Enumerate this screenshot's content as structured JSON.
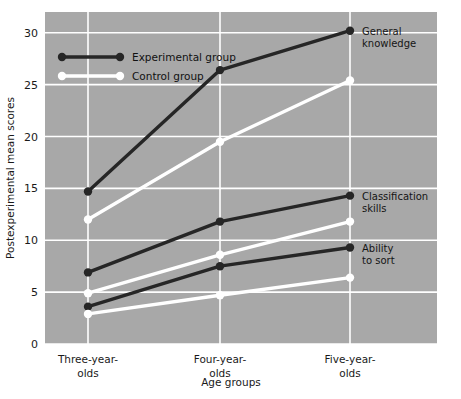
{
  "chart_data": {
    "type": "line",
    "title": "",
    "xlabel": "Age groups",
    "ylabel": "Postexperimental mean scores",
    "categories": [
      "Three-year-\nolds",
      "Four-year-\nolds",
      "Five-year-\nolds"
    ],
    "category_lines": [
      [
        "Three-year-",
        "olds"
      ],
      [
        "Four-year-",
        "olds"
      ],
      [
        "Five-year-",
        "olds"
      ]
    ],
    "x": [
      0,
      1,
      2
    ],
    "ylim": [
      0,
      32
    ],
    "yticks": [
      0,
      5,
      10,
      15,
      20,
      25,
      30
    ],
    "ytick_labels": [
      "0",
      "5",
      "10",
      "15",
      "20",
      "25",
      "30"
    ],
    "grid": true,
    "grid_color": "#ffffff",
    "plot_background": "#a8a8a8",
    "legend_position": "top-left",
    "legend": [
      {
        "name": "Experimental group",
        "color": "#262626",
        "marker": "filled-circle"
      },
      {
        "name": "Control group",
        "color": "#ffffff",
        "marker": "open-circle"
      }
    ],
    "group_annotations": [
      {
        "label_lines": [
          "General",
          "knowledge"
        ],
        "at_x": 2
      },
      {
        "label_lines": [
          "Classification",
          "skills"
        ],
        "at_x": 2
      },
      {
        "label_lines": [
          "Ability",
          "to sort"
        ],
        "at_x": 2
      }
    ],
    "series": [
      {
        "name": "General knowledge — Experimental group",
        "measure": "General knowledge",
        "group": "Experimental group",
        "color": "#262626",
        "values": [
          14.7,
          26.4,
          30.2
        ]
      },
      {
        "name": "General knowledge — Control group",
        "measure": "General knowledge",
        "group": "Control group",
        "color": "#ffffff",
        "values": [
          12.0,
          19.5,
          25.4
        ]
      },
      {
        "name": "Classification skills — Experimental group",
        "measure": "Classification skills",
        "group": "Experimental group",
        "color": "#262626",
        "values": [
          6.9,
          11.8,
          14.3
        ]
      },
      {
        "name": "Classification skills — Control group",
        "measure": "Classification skills",
        "group": "Control group",
        "color": "#ffffff",
        "values": [
          4.9,
          8.6,
          11.8
        ]
      },
      {
        "name": "Ability to sort — Experimental group",
        "measure": "Ability to sort",
        "group": "Experimental group",
        "color": "#262626",
        "values": [
          3.6,
          7.5,
          9.3
        ]
      },
      {
        "name": "Ability to sort — Control group",
        "measure": "Ability to sort",
        "group": "Control group",
        "color": "#ffffff",
        "values": [
          2.9,
          4.7,
          6.4
        ]
      }
    ]
  }
}
